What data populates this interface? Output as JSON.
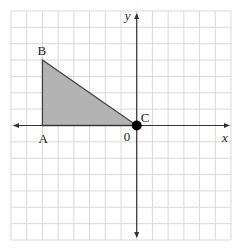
{
  "diagram": {
    "type": "coordinate-plane",
    "grid": {
      "x_min": -8,
      "x_max": 6,
      "y_min": -7,
      "y_max": 7,
      "step": 1
    },
    "axes": {
      "x_label": "x",
      "y_label": "y",
      "origin_label": "0"
    },
    "shape": {
      "name": "triangle ABC",
      "fill": "#b3b3b3",
      "stroke": "#444444",
      "vertices": [
        {
          "label": "A",
          "x": -6,
          "y": 0
        },
        {
          "label": "B",
          "x": -6,
          "y": 4
        },
        {
          "label": "C",
          "x": 0,
          "y": 0
        }
      ]
    },
    "point": {
      "label": "C",
      "x": 0,
      "y": 0,
      "marker": "filled-circle"
    },
    "colors": {
      "grid": "#d9d9d9",
      "axis": "#333333",
      "fill": "#b3b3b3"
    }
  }
}
